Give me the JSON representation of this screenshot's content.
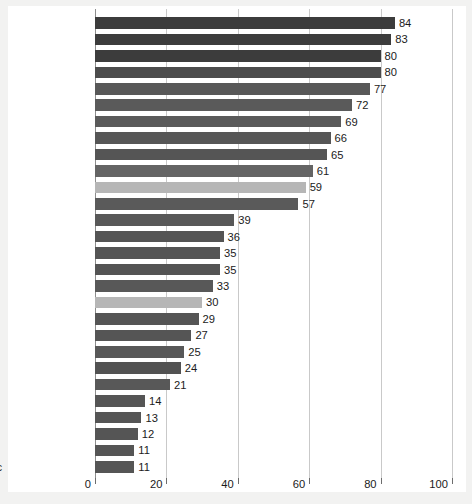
{
  "chart_data": {
    "type": "bar",
    "orientation": "horizontal",
    "title": "",
    "subtitle": "",
    "xlabel": "",
    "ylabel": "",
    "xlim": [
      0,
      100
    ],
    "xticks": [
      0,
      20,
      40,
      60,
      80,
      100
    ],
    "xtick_labels": [
      "0",
      "20",
      "40",
      "60",
      "80",
      "100"
    ],
    "grid": "vertical",
    "legend": "none",
    "categories": [
      "Ghana",
      "Tanzania",
      "Angola",
      "Guatemala",
      "Brazil",
      "Honduras",
      "Peru",
      "Bolivia",
      "Turkey",
      "Venezuela",
      "United States",
      "Mexico",
      "Argentina",
      "Poland",
      "Ukraine",
      "Uzbekistan",
      "Great Britain",
      "Canada",
      "Slovakia",
      "Italy",
      "Korea",
      "Vietnam",
      "Germany",
      "Russia",
      "Bulgaria",
      "Japan",
      "France",
      "Czech Republic"
    ],
    "values": [
      84,
      83,
      80,
      80,
      77,
      72,
      69,
      66,
      65,
      61,
      59,
      57,
      39,
      36,
      35,
      35,
      33,
      30,
      29,
      27,
      25,
      24,
      21,
      14,
      13,
      12,
      11,
      11
    ],
    "bars": [
      {
        "label": "Ghana",
        "value": 84,
        "value_text": "84",
        "color": "#3c3c3c",
        "bold_label": false
      },
      {
        "label": "Tanzania",
        "value": 83,
        "value_text": "83",
        "color": "#3c3c3c",
        "bold_label": false
      },
      {
        "label": "Angola",
        "value": 80,
        "value_text": "80",
        "color": "#3c3c3c",
        "bold_label": false
      },
      {
        "label": "Guatemala",
        "value": 80,
        "value_text": "80",
        "color": "#4c4c4c",
        "bold_label": false
      },
      {
        "label": "Brazil",
        "value": 77,
        "value_text": "77",
        "color": "#585858",
        "bold_label": false
      },
      {
        "label": "Honduras",
        "value": 72,
        "value_text": "72",
        "color": "#5a5a5a",
        "bold_label": false
      },
      {
        "label": "Peru",
        "value": 69,
        "value_text": "69",
        "color": "#5a5a5a",
        "bold_label": false
      },
      {
        "label": "Bolivia",
        "value": 66,
        "value_text": "66",
        "color": "#565656",
        "bold_label": false
      },
      {
        "label": "Turkey",
        "value": 65,
        "value_text": "65",
        "color": "#555555",
        "bold_label": false
      },
      {
        "label": "Venezuela",
        "value": 61,
        "value_text": "61",
        "color": "#646464",
        "bold_label": false
      },
      {
        "label": "United States",
        "value": 59,
        "value_text": "59",
        "color": "#b6b6b6",
        "bold_label": true
      },
      {
        "label": "Mexico",
        "value": 57,
        "value_text": "57",
        "color": "#5a5a5a",
        "bold_label": false
      },
      {
        "label": "Argentina",
        "value": 39,
        "value_text": "39",
        "color": "#585858",
        "bold_label": false
      },
      {
        "label": "Poland",
        "value": 36,
        "value_text": "36",
        "color": "#545454",
        "bold_label": false
      },
      {
        "label": "Ukraine",
        "value": 35,
        "value_text": "35",
        "color": "#545454",
        "bold_label": false
      },
      {
        "label": "Uzbekistan",
        "value": 35,
        "value_text": "35",
        "color": "#545454",
        "bold_label": false
      },
      {
        "label": "Great Britain",
        "value": 33,
        "value_text": "33",
        "color": "#585858",
        "bold_label": false
      },
      {
        "label": "Canada",
        "value": 30,
        "value_text": "30",
        "color": "#b6b6b6",
        "bold_label": false
      },
      {
        "label": "Slovakia",
        "value": 29,
        "value_text": "29",
        "color": "#555555",
        "bold_label": false
      },
      {
        "label": "Italy",
        "value": 27,
        "value_text": "27",
        "color": "#555555",
        "bold_label": false
      },
      {
        "label": "Korea",
        "value": 25,
        "value_text": "25",
        "color": "#585858",
        "bold_label": false
      },
      {
        "label": "Vietnam",
        "value": 24,
        "value_text": "24",
        "color": "#525252",
        "bold_label": false
      },
      {
        "label": "Germany",
        "value": 21,
        "value_text": "21",
        "color": "#585858",
        "bold_label": false
      },
      {
        "label": "Russia",
        "value": 14,
        "value_text": "14",
        "color": "#555555",
        "bold_label": false
      },
      {
        "label": "Bulgaria",
        "value": 13,
        "value_text": "13",
        "color": "#555555",
        "bold_label": false
      },
      {
        "label": "Japan",
        "value": 12,
        "value_text": "12",
        "color": "#555555",
        "bold_label": false
      },
      {
        "label": "France",
        "value": 11,
        "value_text": "11",
        "color": "#555555",
        "bold_label": false
      },
      {
        "label": "Czech Republic",
        "value": 11,
        "value_text": "11",
        "color": "#555555",
        "bold_label": false
      }
    ],
    "colors": {
      "bar_dark": "#3c3c3c",
      "bar_mid": "#585858",
      "bar_highlight": "#b6b6b6",
      "gridline": "#c9c9c9",
      "axis": "#8d8d8d",
      "text": "#1b1b1b",
      "plate": "#ffffff",
      "surround": "#f2f2f1"
    }
  }
}
